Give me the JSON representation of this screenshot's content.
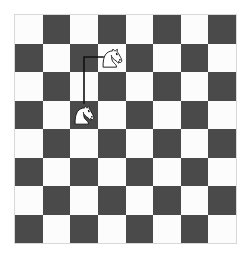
{
  "scene": {
    "title": "Chess knight move diagram",
    "board": {
      "rows": 8,
      "cols": 8,
      "light_color": "#fcfcfc",
      "dark_color": "#4a4a4a",
      "border_color": "#d8d8d8",
      "top_left_square": "light",
      "origin_x": 15,
      "origin_y": 15,
      "square_size": 27.6
    },
    "background_color": "#ffffff",
    "pieces": [
      {
        "id": "knight-destination",
        "type": "knight",
        "color": "white",
        "facing": "right",
        "col": 3,
        "row": 1,
        "square_shade": "light",
        "role": "destination"
      },
      {
        "id": "knight-origin",
        "type": "knight",
        "color": "white",
        "facing": "right",
        "col": 2,
        "row": 3,
        "square_shade": "light",
        "role": "origin"
      }
    ],
    "move_path": {
      "id": "knight-move-line",
      "shape": "L",
      "stroke_color": "#111111",
      "stroke_width": 1.6,
      "description": "up two squares then right one square",
      "points": [
        {
          "x": 69,
          "y": 88
        },
        {
          "x": 69,
          "y": 42
        },
        {
          "x": 88,
          "y": 42
        }
      ]
    }
  }
}
